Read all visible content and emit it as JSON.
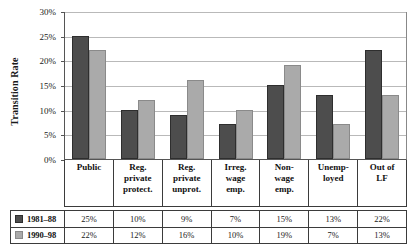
{
  "chart_data": {
    "type": "bar",
    "title": "",
    "xlabel": "",
    "ylabel": "Transition Rate",
    "ylim": [
      0,
      30
    ],
    "ytick_labels": [
      "0%",
      "5%",
      "10%",
      "15%",
      "20%",
      "25%",
      "30%"
    ],
    "ytick_values": [
      0,
      5,
      10,
      15,
      20,
      25,
      30
    ],
    "grid": true,
    "legend_position": "bottom-table",
    "categories": [
      "Public",
      "Reg. private protect.",
      "Reg. private unprot.",
      "Irreg. wage emp.",
      "Non-wage emp.",
      "Unemp-loyed",
      "Out of LF"
    ],
    "category_lines": [
      [
        "Public"
      ],
      [
        "Reg.",
        "private",
        "protect."
      ],
      [
        "Reg.",
        "private",
        "unprot."
      ],
      [
        "Irreg.",
        "wage",
        "emp."
      ],
      [
        "Non-",
        "wage",
        "emp."
      ],
      [
        "Unemp-",
        "loyed"
      ],
      [
        "Out of",
        "LF"
      ]
    ],
    "series": [
      {
        "name": "1981–88",
        "color": "#4d4d4d",
        "values": [
          25,
          10,
          9,
          7,
          15,
          13,
          22
        ],
        "value_labels": [
          "25%",
          "10%",
          "9%",
          "7%",
          "15%",
          "13%",
          "22%"
        ]
      },
      {
        "name": "1990–98",
        "color": "#aaaaaa",
        "values": [
          22,
          12,
          16,
          10,
          19,
          7,
          13
        ],
        "value_labels": [
          "22%",
          "12%",
          "16%",
          "10%",
          "19%",
          "7%",
          "13%"
        ]
      }
    ]
  },
  "colors": {
    "series_1981_88": "#4d4d4d",
    "series_1990_98": "#aaaaaa",
    "gridline": "#b9b9b9",
    "axis": "#555555",
    "table_border": "#3b3b3b",
    "background": "#ffffff"
  }
}
